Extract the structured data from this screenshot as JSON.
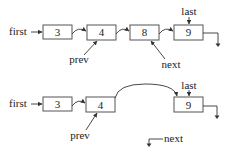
{
  "diagram": {
    "type": "linked-list-deletion",
    "top": {
      "nodes": [
        {
          "value": "3"
        },
        {
          "value": "4"
        },
        {
          "value": "8"
        },
        {
          "value": "9"
        }
      ],
      "labels": {
        "first": "first",
        "last": "last",
        "prev": "prev",
        "next": "next"
      }
    },
    "bottom": {
      "nodes": [
        {
          "value": "3"
        },
        {
          "value": "4"
        },
        {
          "value": "9"
        }
      ],
      "labels": {
        "first": "first",
        "last": "last",
        "prev": "prev",
        "next": "next"
      }
    },
    "colors": {
      "stroke": "#555555",
      "text": "#222222",
      "background": "#ffffff"
    }
  }
}
